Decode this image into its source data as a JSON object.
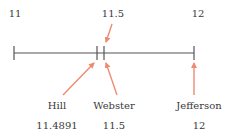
{
  "diagram": {
    "type": "number-line",
    "axis": {
      "min": 11,
      "max": 12,
      "tick_labels": [
        {
          "text": "11",
          "x": 15
        },
        {
          "text": "11.5",
          "x": 113
        },
        {
          "text": "12",
          "x": 198
        }
      ]
    },
    "markers": [
      {
        "name": "Hill",
        "value": "11.4891",
        "tick_x": 97
      },
      {
        "name": "Webster",
        "value": "11.5",
        "tick_x": 104
      },
      {
        "name": "Jefferson",
        "value": "12",
        "tick_x": 194
      }
    ],
    "colors": {
      "line": "#555555",
      "arrow": "#ef8a6f",
      "text": "#3a3a3a"
    }
  }
}
